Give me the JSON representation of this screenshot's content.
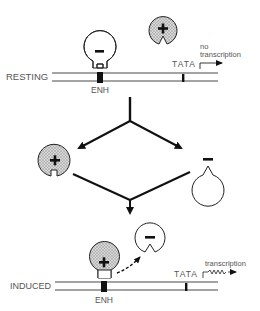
{
  "diagram": {
    "type": "gene-regulation-schematic",
    "states": {
      "resting": {
        "label": "RESTING",
        "enhancer_label": "ENH",
        "promoter_label": "TATA",
        "outcome_label_line1": "no",
        "outcome_label_line2": "transcription",
        "bound_factor_sign": "−",
        "free_factor_sign": "+"
      },
      "transition": {
        "stimulus_label": "serum, TPA",
        "left_factor_sign": "+",
        "right_factor_sign": "−"
      },
      "induced": {
        "label": "INDUCED",
        "enhancer_label": "ENH",
        "promoter_label": "TATA",
        "outcome_label": "transcription",
        "bound_factor_sign": "+",
        "released_factor_sign": "−"
      }
    },
    "colors": {
      "line": "#111111",
      "text": "#555555",
      "activator_fill": "#c8c8c8",
      "repressor_fill": "#ffffff"
    }
  }
}
